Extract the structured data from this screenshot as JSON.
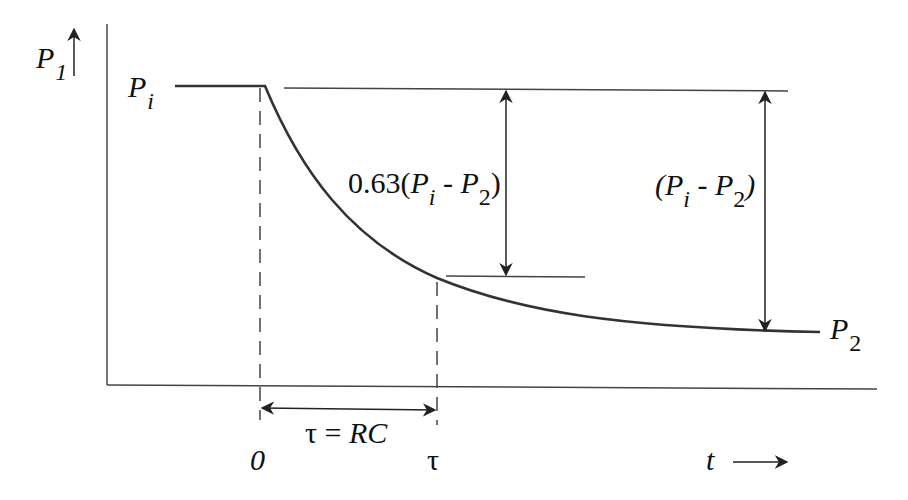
{
  "diagram": {
    "colors": {
      "line": "#333333",
      "text": "#111111",
      "background": "#ffffff"
    },
    "labels": {
      "y_axis": {
        "main": "P",
        "sub": "1"
      },
      "initial_level": {
        "main": "P",
        "sub": "i"
      },
      "final_level": {
        "main": "P",
        "sub": "2"
      },
      "partial_drop": {
        "prefix": "0.63(",
        "p1": "P",
        "s1": "i",
        "mid": " - ",
        "p2": "P",
        "s2": "2",
        "suffix": ")"
      },
      "full_drop": {
        "prefix": "(",
        "p1": "P",
        "s1": "i",
        "mid": " - ",
        "p2": "P",
        "s2": "2",
        "suffix": ")"
      },
      "time_constant": {
        "tau": "τ",
        "eq": " = ",
        "rc": "RC"
      },
      "x_tick_zero": "0",
      "x_tick_tau": "τ",
      "x_axis": "t"
    },
    "curve": {
      "type": "exponential-decay",
      "start_x_px": 265,
      "tau_x_px": 437,
      "end_x_px": 820,
      "pi_y_px": 86,
      "p2_y_px": 335,
      "fraction_at_tau": 0.63
    }
  }
}
